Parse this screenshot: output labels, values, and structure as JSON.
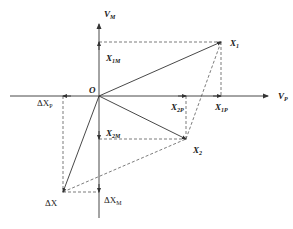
{
  "diagram": {
    "type": "vector-decomposition",
    "colors": {
      "line": "#333333",
      "background": "#ffffff"
    },
    "origin": {
      "label": "O",
      "x": 99,
      "y": 96
    },
    "axes": {
      "horizontal": {
        "label": "V",
        "sub": "P",
        "x1": 10,
        "x2": 268,
        "y": 96
      },
      "vertical": {
        "label": "V",
        "sub": "M",
        "x": 99,
        "y1": 218,
        "y2": 24
      }
    },
    "vectors": [
      {
        "name": "X1",
        "label": "X",
        "sub": "1",
        "x": 221,
        "y": 42,
        "projection_p": {
          "label": "X",
          "sub": "1P"
        },
        "projection_m": {
          "label": "X",
          "sub": "1M"
        }
      },
      {
        "name": "X2",
        "label": "X",
        "sub": "2",
        "x": 186,
        "y": 139,
        "projection_p": {
          "label": "X",
          "sub": "2P"
        },
        "projection_m": {
          "label": "X",
          "sub": "2M"
        }
      },
      {
        "name": "DeltaX",
        "label": "ΔX",
        "sub": "",
        "x": 63,
        "y": 192,
        "projection_p": {
          "label": "ΔX",
          "sub": "P"
        },
        "projection_m": {
          "label": "ΔX",
          "sub": "M"
        }
      }
    ]
  }
}
